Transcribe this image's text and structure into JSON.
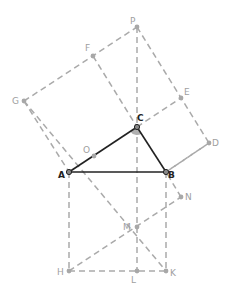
{
  "diagram": {
    "title": "",
    "colors": {
      "dashed": "#aaaaaa",
      "solid": "#222222",
      "angle_fill": "#b0b0b0",
      "label_gray": "#a0a0a0",
      "label_dark": "#222222"
    },
    "points": {
      "P": {
        "x": 137,
        "y": 27,
        "label": "P"
      },
      "F": {
        "x": 93,
        "y": 56,
        "label": "F"
      },
      "G": {
        "x": 24,
        "y": 101,
        "label": "G"
      },
      "E": {
        "x": 181,
        "y": 98,
        "label": "E"
      },
      "C": {
        "x": 137,
        "y": 127,
        "label": "C"
      },
      "D": {
        "x": 209,
        "y": 143,
        "label": "D"
      },
      "A": {
        "x": 69,
        "y": 172,
        "label": "A"
      },
      "B": {
        "x": 166,
        "y": 172,
        "label": "B"
      },
      "O": {
        "x": 94,
        "y": 156,
        "label": "O"
      },
      "N": {
        "x": 181,
        "y": 197,
        "label": "N"
      },
      "M": {
        "x": 137,
        "y": 227,
        "label": "M"
      },
      "H": {
        "x": 69,
        "y": 271,
        "label": "H"
      },
      "L": {
        "x": 137,
        "y": 271,
        "label": "L"
      },
      "K": {
        "x": 166,
        "y": 271,
        "label": "K"
      }
    },
    "solid_segments": [
      [
        "A",
        "B"
      ],
      [
        "B",
        "C"
      ],
      [
        "C",
        "A"
      ]
    ],
    "dashed_segments": [
      [
        "G",
        "P"
      ],
      [
        "P",
        "D"
      ],
      [
        "G",
        "A"
      ],
      [
        "D",
        "B"
      ],
      [
        "F",
        "C"
      ],
      [
        "C",
        "E"
      ],
      [
        "P",
        "L"
      ],
      [
        "A",
        "H"
      ],
      [
        "B",
        "K"
      ],
      [
        "H",
        "K"
      ],
      [
        "G",
        "K"
      ],
      [
        "H",
        "N"
      ],
      [
        "N",
        "B"
      ],
      [
        "B",
        "D"
      ]
    ]
  }
}
